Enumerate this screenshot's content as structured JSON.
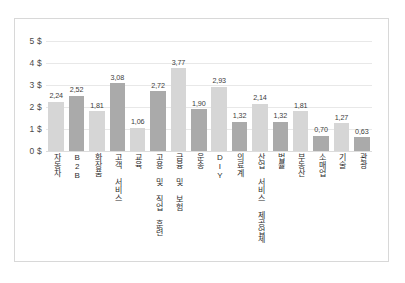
{
  "chart_data": {
    "type": "bar",
    "title": "",
    "xlabel": "",
    "ylabel": "",
    "ylim": [
      0,
      5
    ],
    "grid": true,
    "legend": "none",
    "y_tick_labels": [
      "0 $",
      "1 $",
      "2 $",
      "3 $",
      "4 $",
      "5 $"
    ],
    "y_tick_values": [
      0,
      1,
      2,
      3,
      4,
      5
    ],
    "categories": [
      "자동차",
      "B2B",
      "화장품",
      "고객 서비스",
      "교육",
      "고용 및 직업 훈련",
      "금융 및 보험",
      "운송",
      "DIY",
      "의료계",
      "산업 서비스 제공업체",
      "법률",
      "부동산",
      "소매업",
      "기술",
      "관광"
    ],
    "values": [
      2.24,
      2.52,
      1.81,
      3.08,
      1.06,
      2.72,
      3.77,
      1.9,
      2.93,
      1.32,
      2.14,
      1.32,
      1.81,
      0.7,
      1.27,
      0.63
    ],
    "value_labels": [
      "2,24",
      "2,52",
      "1,81",
      "3,08",
      "1,06",
      "2,72",
      "3,77",
      "1,90",
      "2,93",
      "1,32",
      "2,14",
      "1,32",
      "1,81",
      "0,70",
      "1,27",
      "0,63"
    ],
    "bar_shades": [
      "light",
      "dark",
      "light",
      "dark",
      "light",
      "dark",
      "light",
      "dark",
      "light",
      "dark",
      "light",
      "dark",
      "light",
      "dark",
      "light",
      "dark"
    ],
    "colors": {
      "bar_light": "#d6d6d6",
      "bar_dark": "#aaaaaa",
      "gridline": "#e8e8e8",
      "text": "#2e2e2e",
      "frame_border": "#d8d8d8",
      "background": "#ffffff"
    }
  }
}
